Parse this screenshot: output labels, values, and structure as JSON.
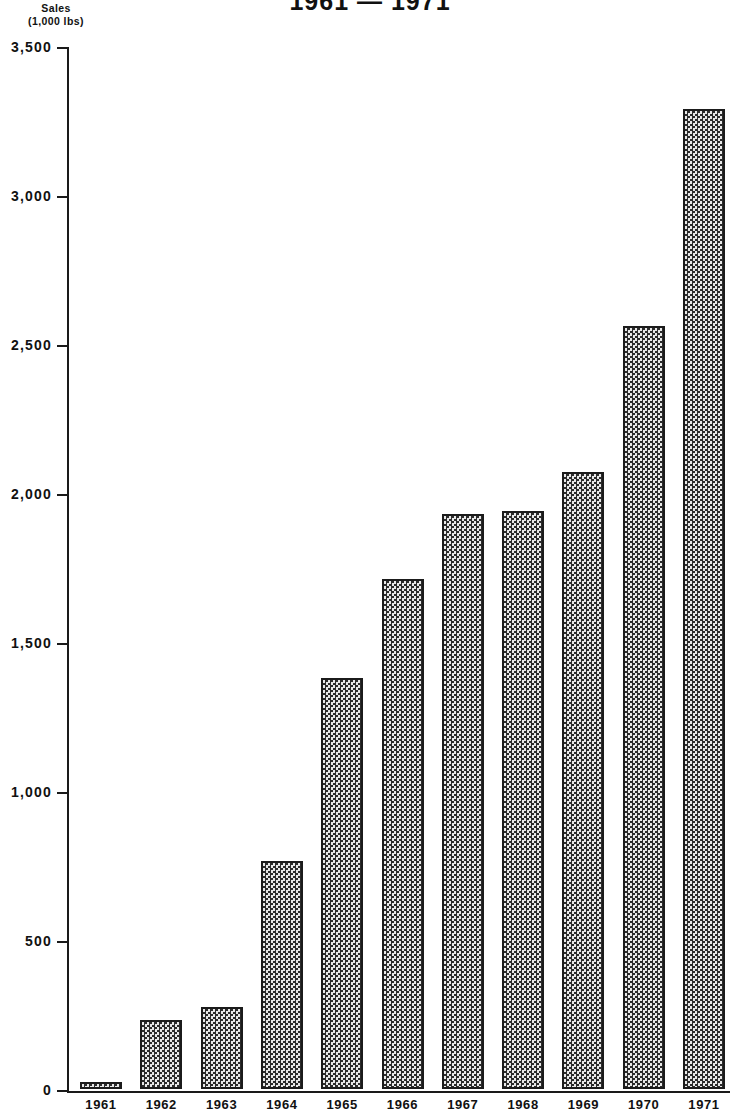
{
  "chart_data": {
    "type": "bar",
    "title": "1961 — 1971",
    "ylabel": "Sales (1,000 lbs)",
    "ylabel_lines": [
      "Sales",
      "(1,000 lbs)"
    ],
    "xlabel": "",
    "categories": [
      "1961",
      "1962",
      "1963",
      "1964",
      "1965",
      "1966",
      "1967",
      "1968",
      "1969",
      "1970",
      "1971"
    ],
    "values": [
      25,
      230,
      275,
      765,
      1380,
      1710,
      1930,
      1940,
      2070,
      2560,
      3290
    ],
    "ylim": [
      0,
      3500
    ],
    "ytick_labels": [
      "3,500",
      "3,000",
      "2,500",
      "2,000",
      "1,500",
      "1,000",
      "500",
      "0"
    ],
    "ytick_values": [
      3500,
      3000,
      2500,
      2000,
      1500,
      1000,
      500,
      0
    ],
    "grid": false,
    "legend": null,
    "bar_style": "checkerboard-hatch",
    "bar_fill_color": "#9a9a9a",
    "bar_edge_color": "#1b1b1b",
    "axis_color": "#1a1a1a",
    "background_color": "#ffffff"
  }
}
